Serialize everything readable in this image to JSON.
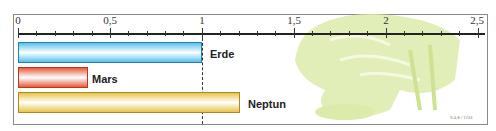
{
  "chart_data": {
    "type": "bar",
    "orientation": "horizontal",
    "title": "",
    "xlabel": "",
    "ylabel": "",
    "xlim": [
      0,
      2.5
    ],
    "grid": false,
    "legend": null,
    "categories": [
      "Erde",
      "Mars",
      "Neptun"
    ],
    "values": [
      1.0,
      0.38,
      1.21
    ],
    "colors": [
      "#56c2ef",
      "#e85a3a",
      "#e8c448"
    ],
    "ticks": [
      {
        "value": 0,
        "label": "0"
      },
      {
        "value": 0.5,
        "label": "0,5"
      },
      {
        "value": 1,
        "label": "1"
      },
      {
        "value": 1.5,
        "label": "1,5"
      },
      {
        "value": 2,
        "label": "2"
      },
      {
        "value": 2.5,
        "label": "2,5"
      }
    ],
    "minor_tick_step": 0.1,
    "reference_line": {
      "value": 1,
      "style": "dashed"
    },
    "annotations": [
      "S.&.E / 1744"
    ]
  },
  "labels": {
    "tick_0": "0",
    "tick_05": "0,5",
    "tick_1": "1",
    "tick_15": "1,5",
    "tick_2": "2",
    "tick_25": "2,5",
    "bar_erde": "Erde",
    "bar_mars": "Mars",
    "bar_neptun": "Neptun",
    "credit": "S.&.E / 1744"
  },
  "colors": {
    "illustration": "#d8e8a0",
    "frame": "#8a8a8a"
  }
}
